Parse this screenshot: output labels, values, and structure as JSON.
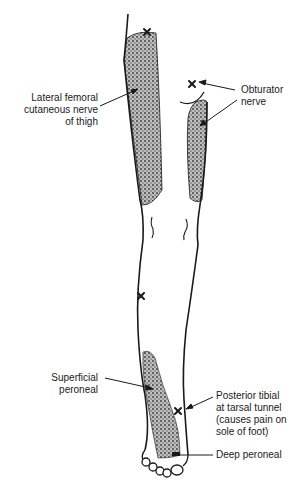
{
  "diagram": {
    "labels": {
      "lateral_femoral": {
        "lines": [
          "Lateral femoral",
          "cutaneous nerve",
          "of thigh"
        ]
      },
      "obturator": {
        "lines": [
          "Obturator",
          "nerve"
        ]
      },
      "superficial_peroneal": {
        "lines": [
          "Superficial",
          "peroneal"
        ]
      },
      "posterior_tibial": {
        "lines": [
          "Posterior tibial",
          "at tarsal tunnel",
          "(causes pain on",
          "sole of foot)"
        ]
      },
      "deep_peroneal": {
        "lines": [
          "Deep peroneal"
        ]
      }
    },
    "markers": [
      {
        "name": "lateral-femoral-entrapment",
        "x": 147,
        "y": 32
      },
      {
        "name": "obturator-entrapment",
        "x": 192,
        "y": 84
      },
      {
        "name": "peroneal-entrapment",
        "x": 141,
        "y": 296
      },
      {
        "name": "tarsal-tunnel-entrapment",
        "x": 178,
        "y": 411
      }
    ],
    "colors": {
      "line": "#1a1a1a",
      "shading": "#8a8a8a",
      "background": "#ffffff"
    }
  }
}
